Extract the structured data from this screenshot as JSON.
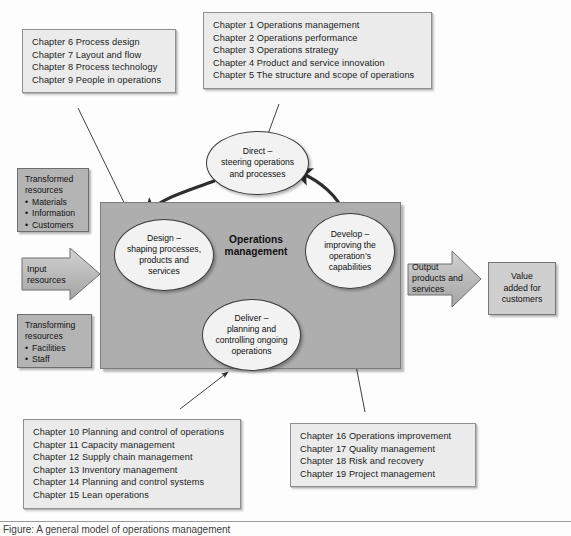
{
  "figure": {
    "footer_caption": "Figure: A general model of operations management"
  },
  "colors": {
    "chapter_box_fill": "#ebebeb",
    "chapter_box_border": "#8f8f8f",
    "operations_box_fill": "#aeaeae",
    "resource_box_fill": "#b4b4b4",
    "value_box_fill": "#cfcfcf",
    "ellipse_fill": "#f2f2f2",
    "ellipse_border": "#3a3a3a",
    "arrow_stroke": "#2b2b2b"
  },
  "chapter_boxes": {
    "top_left": {
      "name": "design-chapters",
      "lines": [
        "Chapter 6 Process design",
        "Chapter 7 Layout and flow",
        "Chapter 8 Process technology",
        "Chapter 9 People in operations"
      ]
    },
    "top_right": {
      "name": "direct-chapters",
      "lines": [
        "Chapter 1 Operations management",
        "Chapter 2 Operations performance",
        "Chapter 3 Operations strategy",
        "Chapter 4 Product and service innovation",
        "Chapter 5 The structure and scope of operations"
      ]
    },
    "bottom_left": {
      "name": "deliver-chapters",
      "lines": [
        "Chapter 10 Planning and control of operations",
        "Chapter 11 Capacity management",
        "Chapter 12 Supply chain management",
        "Chapter 13 Inventory management",
        "Chapter 14 Planning and control systems",
        "Chapter 15 Lean operations"
      ]
    },
    "bottom_right": {
      "name": "develop-chapters",
      "lines": [
        "Chapter 16 Operations improvement",
        "Chapter 17 Quality management",
        "Chapter 18 Risk and recovery",
        "Chapter 19 Project management"
      ]
    }
  },
  "resource_boxes": {
    "transformed": {
      "heading_line_1": "Transformed",
      "heading_line_2": "resources",
      "items": [
        "Materials",
        "Information",
        "Customers"
      ]
    },
    "transforming": {
      "heading_line_1": "Transforming",
      "heading_line_2": "resources",
      "items": [
        "Facilities",
        "Staff"
      ]
    }
  },
  "block_arrows": {
    "input": {
      "line_1": "Input",
      "line_2": "resources"
    },
    "output": {
      "line_1": "Output",
      "line_2": "products and",
      "line_3": "services"
    }
  },
  "value_box": {
    "line_1": "Value",
    "line_2": "added for",
    "line_3": "customers"
  },
  "nodes": {
    "direct": {
      "line_1": "Direct –",
      "line_2": "steering operations",
      "line_3": "and processes"
    },
    "design": {
      "line_1": "Design –",
      "line_2": "shaping processes,",
      "line_3": "products and",
      "line_4": "services"
    },
    "deliver": {
      "line_1": "Deliver –",
      "line_2": "planning and",
      "line_3": "controlling ongoing",
      "line_4": "operations"
    },
    "develop": {
      "line_1": "Develop –",
      "line_2": "improving the",
      "line_3": "operation’s",
      "line_4": "capabilities"
    },
    "centre": {
      "line_1": "Operations",
      "line_2": "management"
    }
  }
}
